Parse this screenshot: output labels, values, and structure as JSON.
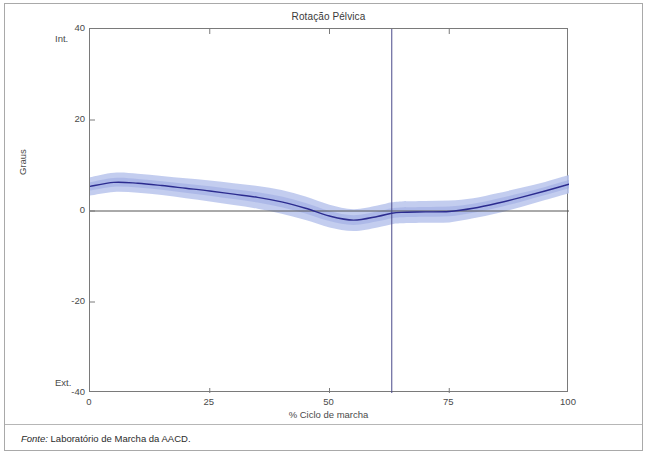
{
  "figure": {
    "title": "Rotação Pélvica",
    "footer_prefix": "Fonte:",
    "footer_text": " Laboratório de Marcha da AACD."
  },
  "axes": {
    "ylabel": "Graus",
    "xlabel": "% Ciclo de marcha",
    "y_top_direction": "Int.",
    "y_bottom_direction": "Ext.",
    "yticks": [
      "40",
      "20",
      "0",
      "-20",
      "-40"
    ],
    "xticks": [
      "0",
      "25",
      "50",
      "75",
      "100"
    ]
  },
  "colors": {
    "band": "#b9c4ec",
    "band_inner": "#9aa9e2",
    "mean_line": "#2b2b8f",
    "axis": "#7a7a7a",
    "zero_line": "#555555",
    "event_line": "#4a4a8a",
    "frame": "#a9a9a9",
    "text": "#4a4a4a"
  },
  "chart_data": {
    "type": "line",
    "title": "Rotação Pélvica",
    "xlabel": "% Ciclo de marcha",
    "ylabel": "Graus",
    "xlim": [
      0,
      100
    ],
    "ylim": [
      -40,
      40
    ],
    "grid": false,
    "legend": "none",
    "y_axis_direction_top": "Int.",
    "y_axis_direction_bottom": "Ext.",
    "annotations": [
      {
        "type": "vline",
        "x": 63,
        "label": "toe-off"
      },
      {
        "type": "hline",
        "y": 0,
        "label": "zero"
      }
    ],
    "x": [
      0,
      5,
      10,
      15,
      20,
      25,
      30,
      35,
      40,
      45,
      50,
      55,
      60,
      63,
      65,
      70,
      75,
      80,
      85,
      90,
      95,
      100
    ],
    "series": [
      {
        "name": "Média",
        "values": [
          5.4,
          6.3,
          6.1,
          5.6,
          5.0,
          4.4,
          3.7,
          3.0,
          2.0,
          0.6,
          -1.1,
          -2.0,
          -1.2,
          -0.5,
          -0.3,
          -0.2,
          -0.1,
          0.6,
          1.7,
          3.0,
          4.4,
          5.9
        ]
      },
      {
        "name": "Desvio superior",
        "values": [
          7.4,
          8.4,
          8.2,
          7.7,
          7.2,
          6.7,
          6.1,
          5.5,
          4.6,
          3.2,
          1.4,
          0.4,
          1.2,
          1.9,
          2.1,
          2.2,
          2.3,
          2.8,
          3.9,
          5.1,
          6.4,
          7.9
        ]
      },
      {
        "name": "Desvio inferior",
        "values": [
          3.4,
          4.2,
          4.0,
          3.5,
          2.8,
          2.1,
          1.3,
          0.5,
          -0.6,
          -2.0,
          -3.6,
          -4.4,
          -3.6,
          -2.9,
          -2.7,
          -2.6,
          -2.5,
          -1.6,
          -0.5,
          0.9,
          2.4,
          3.9
        ]
      }
    ]
  }
}
